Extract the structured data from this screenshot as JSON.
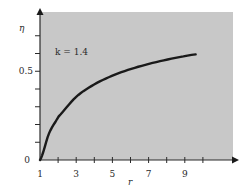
{
  "chart_data": {
    "type": "line",
    "title": "",
    "xlabel": "r",
    "ylabel": "η",
    "annotation": "k = 1.4",
    "xlim": [
      1,
      10.4
    ],
    "ylim": [
      0,
      0.82
    ],
    "x_tick_labels": [
      "1",
      "3",
      "5",
      "7",
      "9"
    ],
    "x_ticks_minor": [
      2,
      4,
      6,
      8,
      10
    ],
    "y_tick_labels": [
      "0",
      "0.5"
    ],
    "y_ticks_minor": [
      0.1,
      0.2,
      0.3,
      0.4,
      0.6,
      0.7
    ],
    "grid": false,
    "legend": null,
    "background_color": "#c8c8c8",
    "line_color": "#1a1a1a",
    "series": [
      {
        "name": "k = 1.4",
        "x": [
          1,
          1.5,
          2,
          3,
          4,
          5,
          6,
          7,
          8,
          9,
          9.6
        ],
        "values": [
          0,
          0.15,
          0.242,
          0.356,
          0.426,
          0.475,
          0.512,
          0.541,
          0.565,
          0.585,
          0.595
        ]
      }
    ]
  }
}
